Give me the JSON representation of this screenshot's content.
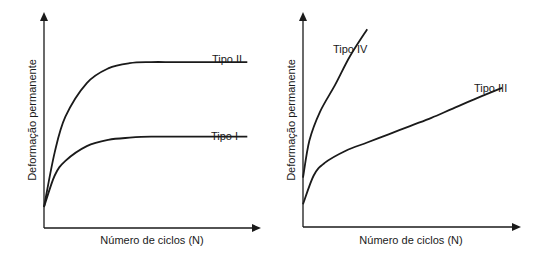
{
  "chart_data": [
    {
      "type": "line",
      "title": "",
      "xlabel": "Número de ciclos (N)",
      "ylabel": "Deformação permanente",
      "xlim": [
        0,
        10
      ],
      "ylim": [
        0,
        10
      ],
      "grid": false,
      "legend": "none (inline curve labels)",
      "series": [
        {
          "name": "Tipo II",
          "x": [
            0,
            0.5,
            1,
            2,
            3,
            4,
            5,
            6,
            7,
            8,
            9,
            9.5
          ],
          "y": [
            1.0,
            3.6,
            5.3,
            6.9,
            7.6,
            7.85,
            7.9,
            7.9,
            7.9,
            7.9,
            7.9,
            7.9
          ]
        },
        {
          "name": "Tipo I",
          "x": [
            0,
            0.5,
            1,
            2,
            3,
            4,
            5,
            6,
            7,
            8,
            9,
            9.5
          ],
          "y": [
            1.0,
            2.5,
            3.2,
            3.9,
            4.2,
            4.3,
            4.35,
            4.35,
            4.35,
            4.35,
            4.35,
            4.35
          ]
        }
      ],
      "annotations": [
        "Tipo II",
        "Tipo I"
      ]
    },
    {
      "type": "line",
      "title": "",
      "xlabel": "Número de ciclos (N)",
      "ylabel": "Deformação permanente",
      "xlim": [
        0,
        10
      ],
      "ylim": [
        0,
        10
      ],
      "grid": false,
      "legend": "none (inline curve labels)",
      "series": [
        {
          "name": "Tipo IV",
          "x": [
            0,
            0.3,
            0.8,
            1.5,
            2.2,
            3.0
          ],
          "y": [
            2.4,
            4.2,
            5.6,
            6.9,
            8.3,
            9.6
          ]
        },
        {
          "name": "Tipo III",
          "x": [
            0,
            0.5,
            1,
            2,
            3,
            4,
            5,
            6,
            7,
            8,
            9.3
          ],
          "y": [
            1.1,
            2.5,
            3.1,
            3.7,
            4.1,
            4.5,
            4.9,
            5.3,
            5.75,
            6.2,
            6.75
          ]
        }
      ],
      "annotations": [
        "Tipo IV",
        "Tipo III"
      ]
    }
  ]
}
